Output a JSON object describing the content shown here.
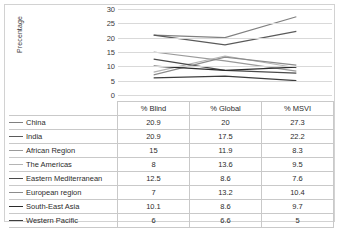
{
  "chart_data": {
    "type": "line",
    "title": "",
    "xlabel": "",
    "ylabel": "Precentage",
    "categories": [
      "% Blind",
      "% Global",
      "% MSVI"
    ],
    "ylim": [
      0,
      30
    ],
    "ytick_step": 5,
    "yticks": [
      30,
      25,
      20,
      15,
      10,
      5,
      0
    ],
    "grid": true,
    "legend_position": "data-table-left",
    "data_table_visible": true,
    "series": [
      {
        "name": "China",
        "values": [
          20.9,
          20,
          27.3
        ],
        "color": "#808080"
      },
      {
        "name": "India",
        "values": [
          20.9,
          17.5,
          22.2
        ],
        "color": "#5a5a5a"
      },
      {
        "name": "African Region",
        "values": [
          15,
          11.9,
          8.3
        ],
        "color": "#9a9a9a"
      },
      {
        "name": "The Americas",
        "values": [
          8,
          13.6,
          9.5
        ],
        "color": "#b4b4b4"
      },
      {
        "name": "Eastern Mediterranean",
        "values": [
          12.5,
          8.6,
          7.6
        ],
        "color": "#4a4a4a"
      },
      {
        "name": "European region",
        "values": [
          7,
          13.2,
          10.4
        ],
        "color": "#8c8c8c"
      },
      {
        "name": "South-East Asia",
        "values": [
          10.1,
          8.6,
          9.7
        ],
        "color": "#2b2b2b"
      },
      {
        "name": "Western Pacific",
        "values": [
          6,
          6.6,
          5
        ],
        "color": "#3d3d3d"
      }
    ]
  },
  "table": {
    "key_header": "",
    "headers": [
      "% Blind",
      "% Global",
      "% MSVI"
    ],
    "rows": [
      {
        "label": "China",
        "blind": "20.9",
        "global": "20",
        "msvi": "27.3"
      },
      {
        "label": "India",
        "blind": "20.9",
        "global": "17.5",
        "msvi": "22.2"
      },
      {
        "label": "African Region",
        "blind": "15",
        "global": "11.9",
        "msvi": "8.3"
      },
      {
        "label": "The Americas",
        "blind": "8",
        "global": "13.6",
        "msvi": "9.5"
      },
      {
        "label": "Eastern Mediterranean",
        "blind": "12.5",
        "global": "8.6",
        "msvi": "7.6"
      },
      {
        "label": "European region",
        "blind": "7",
        "global": "13.2",
        "msvi": "10.4"
      },
      {
        "label": "South-East Asia",
        "blind": "10.1",
        "global": "8.6",
        "msvi": "9.7"
      },
      {
        "label": "Western Pacific",
        "blind": "6",
        "global": "6.6",
        "msvi": "5"
      }
    ]
  }
}
